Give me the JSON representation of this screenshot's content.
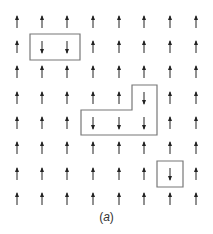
{
  "figure": {
    "caption_open": "(",
    "caption_letter": "a",
    "caption_close": ")",
    "colors": {
      "arrow": "#222222",
      "box": "#777777",
      "background": "#ffffff"
    },
    "grid": {
      "rows": 8,
      "cols": 8,
      "col_x": [
        17,
        42,
        67,
        93,
        119,
        144,
        170,
        196
      ],
      "row_y": [
        22,
        47,
        72,
        98,
        123,
        148,
        174,
        199
      ],
      "spins": [
        [
          "up",
          "up",
          "up",
          "up",
          "up",
          "up",
          "up",
          "up"
        ],
        [
          "up",
          "down",
          "down",
          "up",
          "up",
          "up",
          "up",
          "up"
        ],
        [
          "up",
          "up",
          "up",
          "up",
          "up",
          "up",
          "up",
          "up"
        ],
        [
          "up",
          "up",
          "up",
          "up",
          "up",
          "down",
          "up",
          "up"
        ],
        [
          "up",
          "up",
          "up",
          "down",
          "down",
          "down",
          "up",
          "up"
        ],
        [
          "up",
          "up",
          "up",
          "up",
          "up",
          "up",
          "up",
          "up"
        ],
        [
          "up",
          "up",
          "up",
          "up",
          "up",
          "up",
          "down",
          "up"
        ],
        [
          "up",
          "up",
          "up",
          "up",
          "up",
          "up",
          "up",
          "up"
        ]
      ]
    },
    "domains": [
      {
        "name": "domain-1",
        "points": "30,34 80,34 80,60 30,60"
      },
      {
        "name": "domain-2",
        "points": "132,85 157,85 157,135 81,135 81,110 132,110"
      },
      {
        "name": "domain-3",
        "points": "157,161 183,161 183,187 157,187"
      }
    ]
  }
}
